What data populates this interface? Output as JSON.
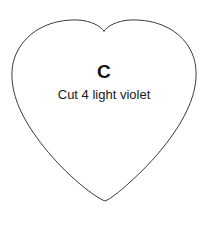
{
  "canvas": {
    "width": 208,
    "height": 235,
    "background_color": "#ffffff"
  },
  "pattern_piece": {
    "shape": "heart-outline",
    "letter": "C",
    "instruction": "Cut 4 light violet",
    "outline_color": "#3a3a3a",
    "outline_width": 1,
    "fill_color": "#ffffff",
    "letter_color": "#111111",
    "instruction_color": "#1a1a1a"
  },
  "geometry": {
    "top_notch_x": 104,
    "top_notch_y": 31,
    "left_lobe_peak_x": 60,
    "left_lobe_peak_y": 21,
    "right_lobe_peak_x": 150,
    "right_lobe_peak_y": 21,
    "left_widest_x": 12,
    "right_widest_x": 196,
    "widest_y": 70,
    "bottom_tip_x": 105,
    "bottom_tip_y": 200
  }
}
